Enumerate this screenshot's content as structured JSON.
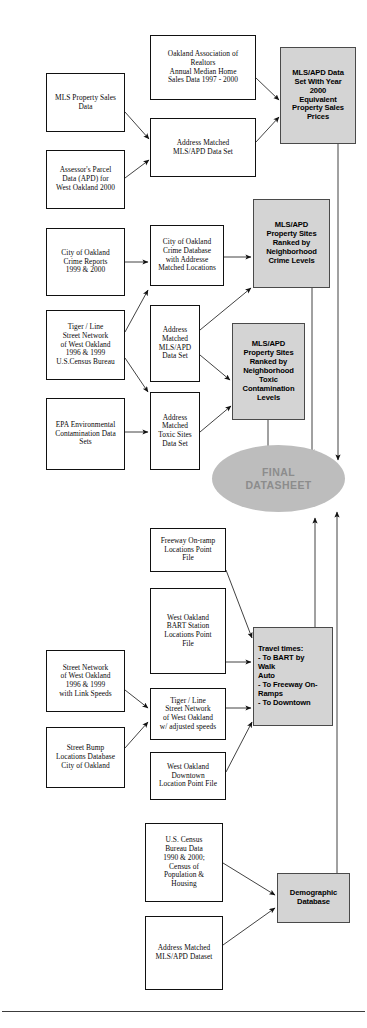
{
  "diagram": {
    "colors": {
      "result_fill": "#d4d4d4",
      "final_fill": "#bdbdbd",
      "final_text": "#8c8c8c",
      "stroke": "#111111",
      "page_background": "#ffffff"
    },
    "nodes": [
      {
        "id": "mls_property_sales",
        "label": "MLS Property Sales\nData",
        "type": "source",
        "x": 46,
        "y": 73,
        "w": 79,
        "h": 59
      },
      {
        "id": "assessor_parcel",
        "label": "Assessor's Parcel\nData (APD) for\nWest Oakland 2000",
        "type": "source",
        "x": 46,
        "y": 150,
        "w": 79,
        "h": 59
      },
      {
        "id": "oakland_realtors",
        "label": "Oakland Association of\nRealtors\nAnnual Median Home\nSales Data 1997 - 2000",
        "type": "process",
        "x": 150,
        "y": 35,
        "w": 106,
        "h": 65
      },
      {
        "id": "address_matched_mlsapd_top",
        "label": "Address Matched\nMLS/APD Data Set",
        "type": "process",
        "x": 150,
        "y": 118,
        "w": 106,
        "h": 59
      },
      {
        "id": "mlsapd_year2000",
        "label": "MLS/APD Data\nSet With Year\n2000\nEquivalent\nProperty Sales\nPrices",
        "type": "result",
        "x": 280,
        "y": 47,
        "w": 76,
        "h": 97
      },
      {
        "id": "crime_reports",
        "label": "City of Oakland\nCrime Reports\n1999 & 2000",
        "type": "source",
        "x": 46,
        "y": 228,
        "w": 79,
        "h": 68
      },
      {
        "id": "crime_database",
        "label": "City of Oakland\nCrime Database\nwith Addresse\nMatched Locations",
        "type": "process",
        "x": 150,
        "y": 225,
        "w": 74,
        "h": 61
      },
      {
        "id": "ranked_crime",
        "label": "MLS/APD\nProperty Sites\nRanked by\nNeighborhood\nCrime Levels",
        "type": "result",
        "x": 253,
        "y": 199,
        "w": 77,
        "h": 89
      },
      {
        "id": "tiger_line_street",
        "label": "Tiger / Line\nStreet Network\nof West Oakland\n1996 & 1999\nU.S.Census Bureau",
        "type": "source",
        "x": 46,
        "y": 310,
        "w": 79,
        "h": 70
      },
      {
        "id": "address_matched_mlsapd_mid",
        "label": "Address\nMatched\nMLS/APD\nData Set",
        "type": "process",
        "x": 150,
        "y": 305,
        "w": 50,
        "h": 77
      },
      {
        "id": "ranked_toxic",
        "label": "MLS/APD\nProperty Sites\nRanked by\nNeighborhood\nToxic\nContamination\nLevels",
        "type": "result",
        "x": 232,
        "y": 323,
        "w": 73,
        "h": 97
      },
      {
        "id": "epa_contamination",
        "label": "EPA Environmental\nContamination Data\nSets",
        "type": "source",
        "x": 46,
        "y": 398,
        "w": 79,
        "h": 72
      },
      {
        "id": "toxic_sites_data",
        "label": "Address\nMatched\nToxic Sites\nData Set",
        "type": "process",
        "x": 150,
        "y": 392,
        "w": 50,
        "h": 78
      },
      {
        "id": "final_datasheet",
        "label": "FINAL\nDATASHEET",
        "type": "final",
        "x": 212,
        "y": 445,
        "w": 133,
        "h": 67
      },
      {
        "id": "freeway_onramp",
        "label": "Freeway On-ramp\nLocations Point\nFile",
        "type": "process",
        "x": 150,
        "y": 528,
        "w": 76,
        "h": 44
      },
      {
        "id": "bart_station",
        "label": "West Oakland\nBART Station\nLocations Point\nFile",
        "type": "process",
        "x": 150,
        "y": 588,
        "w": 76,
        "h": 86
      },
      {
        "id": "street_network_speeds",
        "label": "Street Network\nof West Oakland\n1996 & 1999\nwith Link Speeds",
        "type": "source",
        "x": 46,
        "y": 650,
        "w": 79,
        "h": 62
      },
      {
        "id": "street_bump",
        "label": "Street Bump\nLocations Database\nCity of Oakland",
        "type": "source",
        "x": 46,
        "y": 727,
        "w": 79,
        "h": 61
      },
      {
        "id": "tiger_adjusted",
        "label": "Tiger / Line\nStreet Network\nof West Oakland\nw/ adjusted speeds",
        "type": "process",
        "x": 150,
        "y": 688,
        "w": 76,
        "h": 52
      },
      {
        "id": "downtown_point",
        "label": "West Oakland\nDowntown\nLocation Point File",
        "type": "process",
        "x": 150,
        "y": 752,
        "w": 76,
        "h": 48
      },
      {
        "id": "travel_times",
        "label": "Travel times:\n- To BART by\n     Walk\n     Auto\n- To Freeway On-\nRamps\n- To Downtown",
        "type": "result-left",
        "x": 253,
        "y": 627,
        "w": 80,
        "h": 99
      },
      {
        "id": "us_census",
        "label": "U.S. Census\nBureau Data\n1990 & 2000;\nCensus of\nPopulation &\nHousing",
        "type": "process",
        "x": 145,
        "y": 823,
        "w": 78,
        "h": 79
      },
      {
        "id": "address_matched_dataset",
        "label": "Address Matched\nMLS/APD Dataset",
        "type": "process",
        "x": 145,
        "y": 916,
        "w": 78,
        "h": 74
      },
      {
        "id": "demographic_database",
        "label": "Demographic\nDatabase",
        "type": "result",
        "x": 277,
        "y": 873,
        "w": 73,
        "h": 50
      }
    ],
    "edges": [
      {
        "from": "mls_property_sales",
        "to": "address_matched_mlsapd_top"
      },
      {
        "from": "assessor_parcel",
        "to": "address_matched_mlsapd_top"
      },
      {
        "from": "oakland_realtors",
        "to": "mlsapd_year2000"
      },
      {
        "from": "address_matched_mlsapd_top",
        "to": "mlsapd_year2000"
      },
      {
        "from": "crime_reports",
        "to": "crime_database"
      },
      {
        "from": "crime_database",
        "to": "ranked_crime"
      },
      {
        "from": "tiger_line_street",
        "to": "crime_database"
      },
      {
        "from": "tiger_line_street",
        "to": "toxic_sites_data"
      },
      {
        "from": "address_matched_mlsapd_mid",
        "to": "ranked_crime"
      },
      {
        "from": "address_matched_mlsapd_mid",
        "to": "ranked_toxic"
      },
      {
        "from": "epa_contamination",
        "to": "toxic_sites_data"
      },
      {
        "from": "toxic_sites_data",
        "to": "ranked_toxic"
      },
      {
        "from": "ranked_toxic",
        "to": "final_datasheet"
      },
      {
        "from": "ranked_crime",
        "to": "final_datasheet"
      },
      {
        "from": "mlsapd_year2000",
        "to": "final_datasheet"
      },
      {
        "from": "freeway_onramp",
        "to": "travel_times"
      },
      {
        "from": "bart_station",
        "to": "travel_times"
      },
      {
        "from": "street_network_speeds",
        "to": "tiger_adjusted"
      },
      {
        "from": "street_bump",
        "to": "tiger_adjusted"
      },
      {
        "from": "tiger_adjusted",
        "to": "travel_times"
      },
      {
        "from": "downtown_point",
        "to": "travel_times"
      },
      {
        "from": "travel_times",
        "to": "final_datasheet"
      },
      {
        "from": "us_census",
        "to": "demographic_database"
      },
      {
        "from": "address_matched_dataset",
        "to": "demographic_database"
      },
      {
        "from": "demographic_database",
        "to": "final_datasheet"
      }
    ]
  }
}
